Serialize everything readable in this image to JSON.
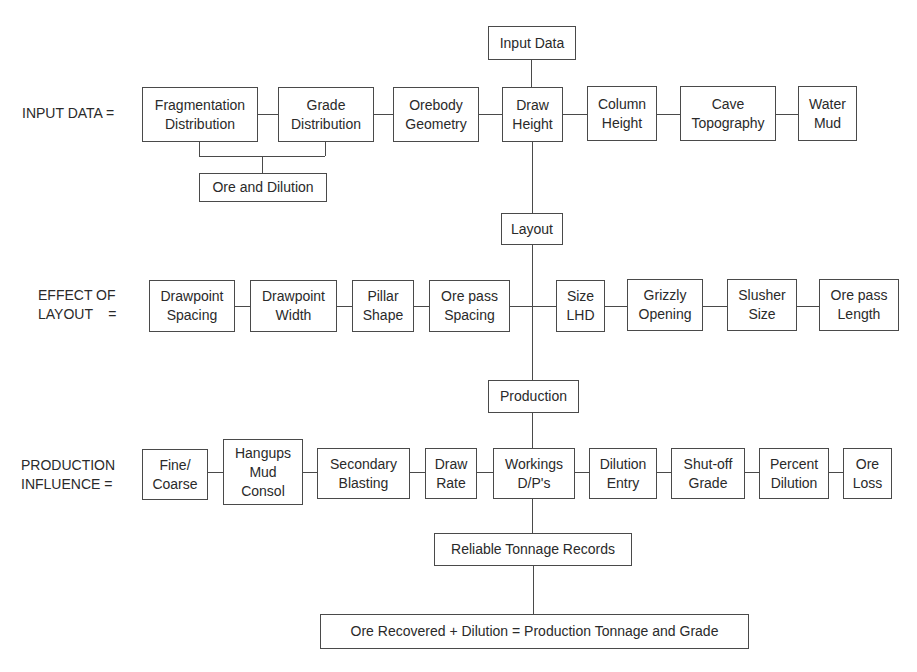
{
  "diagram": {
    "type": "flowchart",
    "top": {
      "input_data": "Input Data"
    },
    "row_labels": {
      "input": "INPUT DATA =",
      "layout": "EFFECT OF\nLAYOUT    =",
      "production": "PRODUCTION\nINFLUENCE ="
    },
    "input_row": {
      "fragmentation": "Fragmentation\nDistribution",
      "grade": "Grade\nDistribution",
      "orebody": "Orebody\nGeometry",
      "draw_height": "Draw\nHeight",
      "column_height": "Column\nHeight",
      "cave_topography": "Cave\nTopography",
      "water_mud": "Water\nMud",
      "ore_dilution": "Ore and Dilution"
    },
    "layout_node": "Layout",
    "layout_row": {
      "drawpoint_spacing": "Drawpoint\nSpacing",
      "drawpoint_width": "Drawpoint\nWidth",
      "pillar_shape": "Pillar\nShape",
      "orepass_spacing": "Ore pass\nSpacing",
      "size_lhd": "Size\nLHD",
      "grizzly_opening": "Grizzly\nOpening",
      "slusher_size": "Slusher\nSize",
      "orepass_length": "Ore pass\nLength"
    },
    "production_node": "Production",
    "production_row": {
      "fine_coarse": "Fine/\nCoarse",
      "hangups": "Hangups\nMud\nConsol",
      "secondary_blasting": "Secondary\nBlasting",
      "draw_rate": "Draw\nRate",
      "workings": "Workings\nD/P's",
      "dilution_entry": "Dilution\nEntry",
      "shutoff_grade": "Shut-off\nGrade",
      "percent_dilution": "Percent\nDilution",
      "ore_loss": "Ore\nLoss"
    },
    "tonnage_node": "Reliable Tonnage Records",
    "result_node": "Ore Recovered + Dilution = Production Tonnage and Grade"
  }
}
